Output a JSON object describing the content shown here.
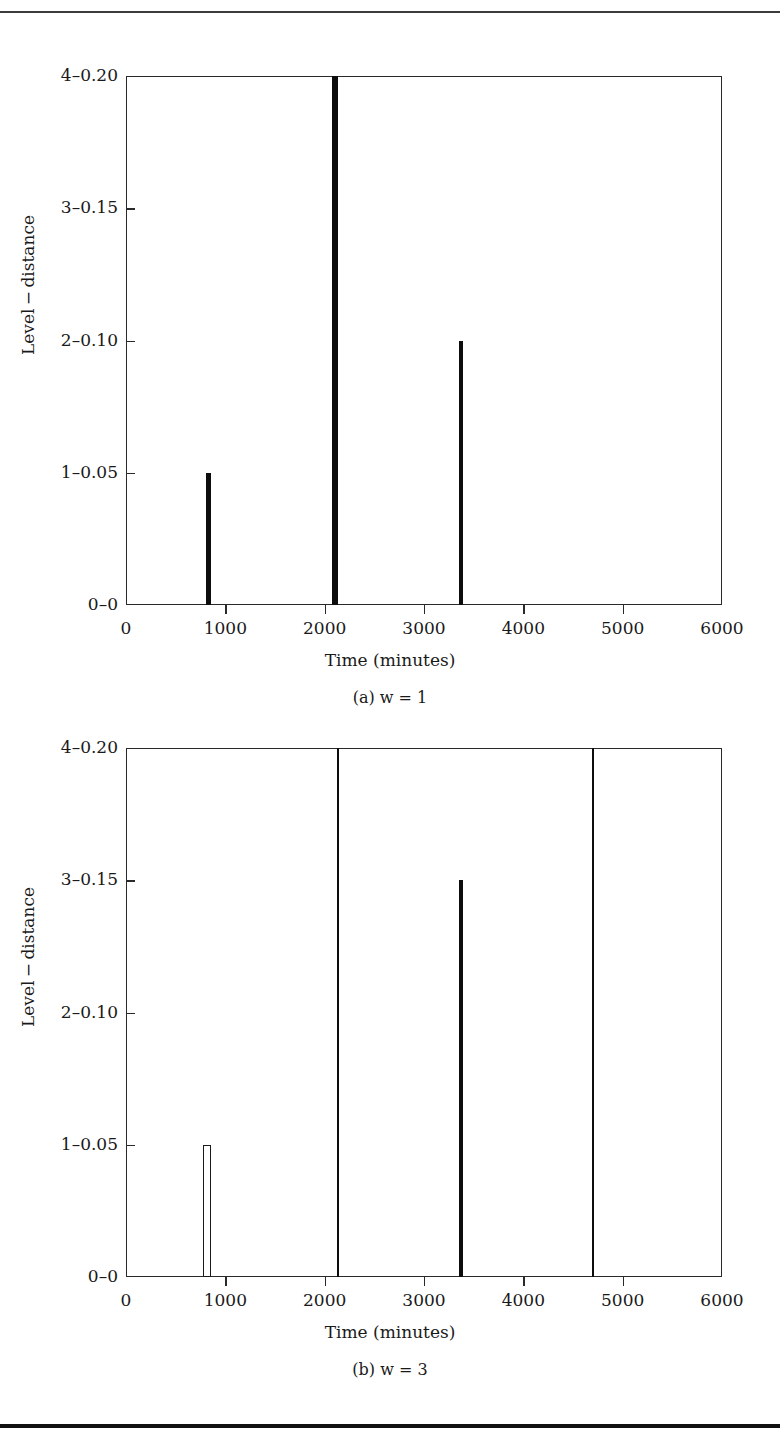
{
  "page": {
    "running_head": "",
    "background": "#ffffff",
    "ink": "#0d0d0d"
  },
  "figures": [
    {
      "id": "a",
      "caption": "(a) w = 1",
      "chart_data": {
        "type": "bar",
        "title": "",
        "subtitle": "(a) w = 1",
        "xlabel": "Time (minutes)",
        "ylabel": "Level − distance",
        "xlim": [
          0,
          6000
        ],
        "ylim": [
          0,
          4
        ],
        "grid": false,
        "legend": "none",
        "xticks": [
          0,
          1000,
          2000,
          3000,
          4000,
          5000,
          6000
        ],
        "xticklabels": [
          "0",
          "1000",
          "2000",
          "3000",
          "4000",
          "5000",
          "6000"
        ],
        "yticks": [
          0,
          1,
          2,
          3,
          4
        ],
        "yticklabels": [
          "0–0",
          "1–0.05",
          "2–0.10",
          "3–0.15",
          "4–0.20"
        ],
        "bars": [
          {
            "x": 830,
            "level": 1,
            "distance": 0.05,
            "style": "solid",
            "width_px": 5
          },
          {
            "x": 2100,
            "level": 4,
            "distance": 0.2,
            "style": "solid",
            "width_px": 6
          },
          {
            "x": 3370,
            "level": 2,
            "distance": 0.1,
            "style": "solid",
            "width_px": 4
          }
        ]
      }
    },
    {
      "id": "b",
      "caption": "(b) w = 3",
      "chart_data": {
        "type": "bar",
        "title": "",
        "subtitle": "(b) w = 3",
        "xlabel": "Time (minutes)",
        "ylabel": "Level − distance",
        "xlim": [
          0,
          6000
        ],
        "ylim": [
          0,
          4
        ],
        "grid": false,
        "legend": "none",
        "xticks": [
          0,
          1000,
          2000,
          3000,
          4000,
          5000,
          6000
        ],
        "xticklabels": [
          "0",
          "1000",
          "2000",
          "3000",
          "4000",
          "5000",
          "6000"
        ],
        "yticks": [
          0,
          1,
          2,
          3,
          4
        ],
        "yticklabels": [
          "0–0",
          "1–0.05",
          "2–0.10",
          "3–0.15",
          "4–0.20"
        ],
        "bars": [
          {
            "x": 820,
            "level": 1,
            "distance": 0.05,
            "style": "hollow",
            "width_px": 8
          },
          {
            "x": 2130,
            "level": 4,
            "distance": 0.2,
            "style": "solid",
            "width_px": 2
          },
          {
            "x": 3370,
            "level": 3,
            "distance": 0.15,
            "style": "solid",
            "width_px": 4
          },
          {
            "x": 4700,
            "level": 4,
            "distance": 0.2,
            "style": "solid",
            "width_px": 2
          }
        ]
      }
    }
  ]
}
